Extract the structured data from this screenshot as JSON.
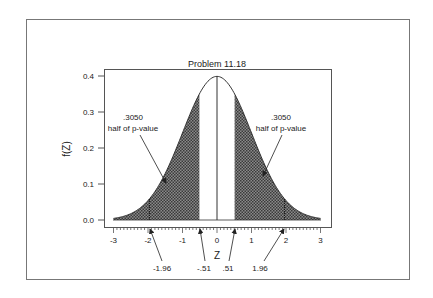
{
  "chart_data": {
    "type": "area",
    "title": "Problem 11.18",
    "xlabel": "Z",
    "ylabel": "f(Z)",
    "xlim": [
      -3,
      3
    ],
    "ylim": [
      0.0,
      0.4
    ],
    "x_ticks": [
      "-3",
      "-2",
      "-1",
      "0",
      "1",
      "2",
      "3"
    ],
    "y_ticks": [
      "0.0",
      "0.1",
      "0.2",
      "0.3",
      "0.4"
    ],
    "grid": false,
    "legend": null,
    "curve": "standard normal density f(Z)",
    "shaded_regions": [
      {
        "from": -3,
        "to": -0.51,
        "label": "left tail"
      },
      {
        "from": 0.51,
        "to": 3,
        "label": "right tail"
      }
    ],
    "reference_lines": [
      -1.96,
      0,
      1.96
    ],
    "annotations": [
      {
        "text": ".3050",
        "subtext": "half of p-value",
        "side": "left"
      },
      {
        "text": ".3050",
        "subtext": "half of p-value",
        "side": "right"
      }
    ],
    "axis_callouts": [
      "-1.96",
      "-.51",
      ".51",
      "1.96"
    ],
    "series": [
      {
        "name": "f(Z)",
        "x": [
          -3,
          -2.5,
          -2,
          -1.96,
          -1.5,
          -1,
          -0.51,
          0,
          0.51,
          1,
          1.5,
          1.96,
          2,
          2.5,
          3
        ],
        "values": [
          0.004,
          0.018,
          0.054,
          0.058,
          0.13,
          0.242,
          0.35,
          0.399,
          0.35,
          0.242,
          0.13,
          0.058,
          0.054,
          0.018,
          0.004
        ]
      }
    ]
  },
  "labels": {
    "title": "Problem 11.18",
    "xlabel": "Z",
    "ylabel": "f(Z)",
    "ann_left_value": ".3050",
    "ann_left_text": "half of p-value",
    "ann_right_value": ".3050",
    "ann_right_text": "half of p-value",
    "callout_m196": "-1.96",
    "callout_m051": "-.51",
    "callout_051": ".51",
    "callout_196": "1.96",
    "xt0": "-3",
    "xt1": "-2",
    "xt2": "-1",
    "xt3": "0",
    "xt4": "1",
    "xt5": "2",
    "xt6": "3",
    "yt0": "0.0",
    "yt1": "0.1",
    "yt2": "0.2",
    "yt3": "0.3",
    "yt4": "0.4"
  },
  "colors": {
    "shade": "#555555",
    "line": "#333333",
    "frame": "#666666"
  }
}
